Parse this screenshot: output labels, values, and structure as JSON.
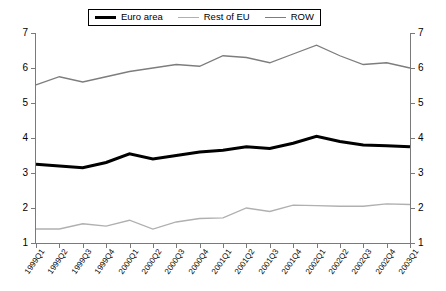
{
  "legend": {
    "position": "top-center",
    "items": [
      {
        "label": "Euro area",
        "color": "#000000",
        "width": 3
      },
      {
        "label": "Rest of EU",
        "color": "#b0b0b0",
        "width": 1
      },
      {
        "label": "ROW",
        "color": "#7d7d7d",
        "width": 1
      }
    ]
  },
  "chart_data": {
    "type": "line",
    "title": "",
    "xlabel": "",
    "ylabel": "",
    "ylim": [
      1,
      7
    ],
    "yticks": [
      1,
      2,
      3,
      4,
      5,
      6,
      7
    ],
    "ytick_labels": [
      "1",
      "2",
      "3",
      "4",
      "5",
      "6",
      "7"
    ],
    "dual_axis": true,
    "right_axis_ticks": [
      1,
      2,
      3,
      4,
      5,
      6,
      7
    ],
    "right_axis_tick_labels": [
      "1",
      "2",
      "3",
      "4",
      "5",
      "6",
      "7"
    ],
    "grid": false,
    "legend_position": "top-center",
    "categories": [
      "1999Q1",
      "1999Q2",
      "1999Q3",
      "1999Q4",
      "2000Q1",
      "2000Q2",
      "2000Q3",
      "2000Q4",
      "2001Q1",
      "2001Q2",
      "2001Q3",
      "2001Q4",
      "2002Q1",
      "2002Q2",
      "2002Q3",
      "2002Q4",
      "2003Q1"
    ],
    "series": [
      {
        "name": "Euro area",
        "color": "#000000",
        "line_width": 3,
        "values": [
          3.25,
          3.2,
          3.15,
          3.3,
          3.55,
          3.4,
          3.5,
          3.6,
          3.65,
          3.75,
          3.7,
          3.85,
          4.05,
          3.9,
          3.8,
          3.78,
          3.75
        ]
      },
      {
        "name": "Rest of EU",
        "color": "#b0b0b0",
        "line_width": 1.3,
        "values": [
          1.4,
          1.4,
          1.55,
          1.48,
          1.65,
          1.4,
          1.6,
          1.7,
          1.72,
          2.0,
          1.9,
          2.08,
          2.07,
          2.05,
          2.05,
          2.12,
          2.1
        ]
      },
      {
        "name": "ROW",
        "color": "#7d7d7d",
        "line_width": 1.3,
        "values": [
          5.52,
          5.75,
          5.6,
          5.75,
          5.9,
          6.0,
          6.1,
          6.05,
          6.35,
          6.3,
          6.15,
          6.4,
          6.65,
          6.35,
          6.1,
          6.15,
          6.0
        ]
      }
    ]
  }
}
